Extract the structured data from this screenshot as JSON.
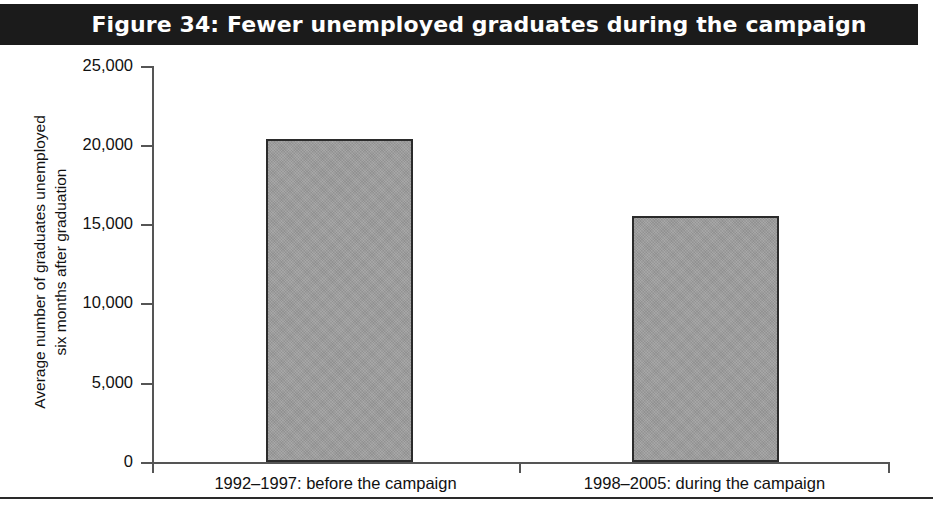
{
  "figure": {
    "title": "Figure 34: Fewer unemployed graduates during the campaign",
    "banner_color": "#1b1b1b",
    "banner_text_color": "#ffffff",
    "bar_fill_color": "#9e9e9e",
    "bar_border_color": "#2b2b2b",
    "axis_color": "#555555"
  },
  "chart_data": {
    "type": "bar",
    "title": "Figure 34: Fewer unemployed graduates during the campaign",
    "categories": [
      "1992–1997: before the campaign",
      "1998–2005: during the campaign"
    ],
    "values": [
      20400,
      15500
    ],
    "xlabel": "",
    "ylabel": "Average number of graduates unemployed six months after graduation",
    "ylabel_lines": [
      "Average number of graduates unemployed",
      "six months after graduation"
    ],
    "ylim": [
      0,
      25000
    ],
    "yticks": [
      0,
      5000,
      10000,
      15000,
      20000,
      25000
    ],
    "ytick_labels": [
      "0",
      "5,000",
      "10,000",
      "15,000",
      "20,000",
      "25,000"
    ],
    "grid": false,
    "legend": null
  }
}
